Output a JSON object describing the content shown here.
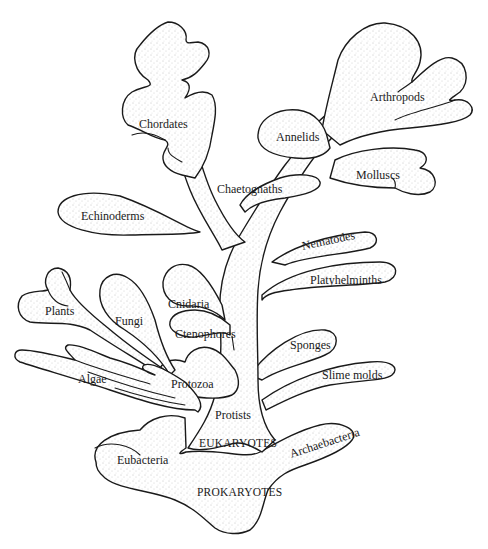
{
  "diagram": {
    "type": "phylogenetic-tree",
    "style": "stippled branching tree of life",
    "root": {
      "label": "PROKARYOTES",
      "children": [
        {
          "label": "Eubacteria"
        },
        {
          "label": "Archaebacteria"
        },
        {
          "label": "EUKARYOTES",
          "children": [
            {
              "label": "Protists",
              "children": [
                {
                  "label": "Slime molds"
                },
                {
                  "label": "Algae"
                },
                {
                  "label": "Protozoa",
                  "children": [
                    {
                      "label": "Plants"
                    },
                    {
                      "label": "Fungi"
                    },
                    {
                      "label": "Sponges"
                    },
                    {
                      "label": "Ctenophores"
                    },
                    {
                      "label": "Cnidaria"
                    },
                    {
                      "label": "Platyhelminths"
                    },
                    {
                      "label": "Nematodes"
                    },
                    {
                      "label": "Annelids"
                    },
                    {
                      "label": "Molluscs"
                    },
                    {
                      "label": "Arthropods"
                    },
                    {
                      "label": "Chaetognaths"
                    },
                    {
                      "label": "Echinoderms"
                    },
                    {
                      "label": "Chordates"
                    }
                  ]
                }
              ]
            }
          ]
        }
      ]
    }
  },
  "labels": {
    "chordates": "Chordates",
    "arthropods": "Arthropods",
    "annelids": "Annelids",
    "molluscs": "Molluscs",
    "chaetognaths": "Chaetognaths",
    "echinoderms": "Echinoderms",
    "nematodes": "Nematodes",
    "platyhelminths": "Platyhelminths",
    "plants": "Plants",
    "fungi": "Fungi",
    "cnidaria": "Cnidaria",
    "ctenophores": "Ctenophores",
    "sponges": "Sponges",
    "algae": "Algae",
    "protozoa": "Protozoa",
    "slime_molds": "Slime molds",
    "protists": "Protists",
    "eukaryotes": "EUKARYOTES",
    "eubacteria": "Eubacteria",
    "archaebacteria": "Archaebacteria",
    "prokaryotes": "PROKARYOTES"
  },
  "colors": {
    "ink": "#1a1a1a",
    "background": "#ffffff",
    "stipple": "#9a9a9a"
  }
}
